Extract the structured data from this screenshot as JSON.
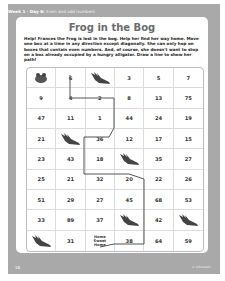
{
  "header": {
    "week_day": "Week 1 · Day 6",
    "topic": "Even and odd numbers"
  },
  "title": "Frog in the Bog",
  "instructions": "Help! Frances the Frog is lost in the bog. Help her find her way home. Move one box at a time in any direction except diagonally. She can only hop on boxes that contain even numbers. And, of course, she doesn't want to stop on a box already occupied by a hungry alligator. Draw a line to show her path!",
  "grid": {
    "rows": [
      [
        {
          "type": "frog"
        },
        {
          "v": "6"
        },
        {
          "type": "gator"
        },
        {
          "v": "3"
        },
        {
          "v": "5"
        },
        {
          "v": "7"
        }
      ],
      [
        {
          "v": "9"
        },
        {
          "v": "4"
        },
        {
          "v": "2"
        },
        {
          "v": "8"
        },
        {
          "v": "13"
        },
        {
          "v": "75"
        }
      ],
      [
        {
          "v": "47"
        },
        {
          "v": "11"
        },
        {
          "v": "1"
        },
        {
          "v": "44"
        },
        {
          "v": "24"
        },
        {
          "v": "19"
        }
      ],
      [
        {
          "v": "21"
        },
        {
          "type": "gator"
        },
        {
          "v": "36"
        },
        {
          "v": "12"
        },
        {
          "v": "17"
        },
        {
          "v": "15"
        }
      ],
      [
        {
          "v": "23"
        },
        {
          "v": "43"
        },
        {
          "v": "18"
        },
        {
          "type": "gator"
        },
        {
          "v": "35"
        },
        {
          "v": "27"
        }
      ],
      [
        {
          "v": "25"
        },
        {
          "v": "21"
        },
        {
          "v": "32"
        },
        {
          "v": "20"
        },
        {
          "v": "22"
        },
        {
          "v": "26"
        }
      ],
      [
        {
          "v": "51"
        },
        {
          "v": "29"
        },
        {
          "v": "27"
        },
        {
          "v": "45"
        },
        {
          "v": "68"
        },
        {
          "v": "53"
        }
      ],
      [
        {
          "v": "33"
        },
        {
          "v": "89"
        },
        {
          "v": "37"
        },
        {
          "type": "gator"
        },
        {
          "v": "42"
        },
        {
          "type": "gator"
        }
      ],
      [
        {
          "type": "gator"
        },
        {
          "v": "31"
        },
        {
          "type": "home",
          "v": "Home\nSweet\nHome"
        },
        {
          "v": "38"
        },
        {
          "v": "64"
        },
        {
          "v": "59"
        }
      ]
    ],
    "cells": [
      "",
      "6",
      "",
      "3",
      "5",
      "7",
      "9",
      "4",
      "2",
      "8",
      "13",
      "75",
      "47",
      "11",
      "1",
      "44",
      "24",
      "19",
      "21",
      "",
      "36",
      "12",
      "17",
      "15",
      "23",
      "43",
      "18",
      "",
      "35",
      "27",
      "25",
      "21",
      "32",
      "20",
      "22",
      "26",
      "51",
      "29",
      "27",
      "45",
      "68",
      "53",
      "33",
      "89",
      "37",
      "",
      "42",
      "",
      "",
      "31",
      "Home\nSweet\nHome",
      "38",
      "64",
      "59"
    ]
  },
  "colors": {
    "frame": "#a9a9a9",
    "path": "#555555",
    "title": "#6b6b6b"
  },
  "footer": {
    "page_number": "18",
    "credit": "© Scholastic"
  }
}
